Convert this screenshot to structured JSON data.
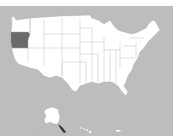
{
  "map": {
    "title": "United States",
    "highlighted_state": "Oregon",
    "colors": {
      "background": "#bdbdbd",
      "land": "#ffffff",
      "highlight": "#6a6a6a",
      "border": "#9a9a9a"
    },
    "regions": [
      "Contiguous United States",
      "Alaska",
      "Hawaii",
      "Puerto Rico"
    ]
  }
}
